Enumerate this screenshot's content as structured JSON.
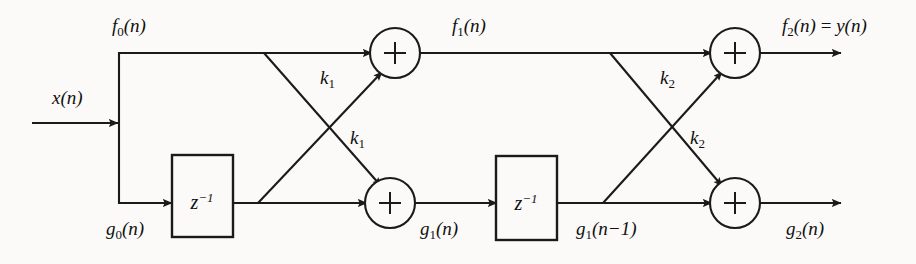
{
  "figure": {
    "kind": "signal-flow-graph",
    "background_color": "#fbfaf8",
    "line_color": "#1a1a1a",
    "width": 916,
    "height": 264
  },
  "signals": {
    "input": {
      "base": "x",
      "sub": "",
      "arg": "(n)"
    },
    "f0": {
      "base": "f",
      "sub": "0",
      "arg": "(n)"
    },
    "g0": {
      "base": "g",
      "sub": "0",
      "arg": "(n)"
    },
    "f1": {
      "base": "f",
      "sub": "1",
      "arg": "(n)"
    },
    "g1": {
      "base": "g",
      "sub": "1",
      "arg": "(n)"
    },
    "g1_delayed": {
      "base": "g",
      "sub": "1",
      "arg": "(n−1)"
    },
    "f2_out": {
      "base": "f",
      "sub": "2",
      "arg": "(n)",
      "equals": " = ",
      "alias_base": "y",
      "alias_arg": "(n)"
    },
    "g2": {
      "base": "g",
      "sub": "2",
      "arg": "(n)"
    }
  },
  "coefficients": [
    {
      "id": "k1-upper",
      "base": "k",
      "sub": "1"
    },
    {
      "id": "k1-lower",
      "base": "k",
      "sub": "1"
    },
    {
      "id": "k2-upper",
      "base": "k",
      "sub": "2"
    },
    {
      "id": "k2-lower",
      "base": "k",
      "sub": "2"
    }
  ],
  "blocks": {
    "delay1": {
      "base": "z",
      "sup": "−1"
    },
    "delay2": {
      "base": "z",
      "sup": "−1"
    }
  },
  "adders": [
    {
      "id": "adder-f1",
      "symbol": "+"
    },
    {
      "id": "adder-g1",
      "symbol": "+"
    },
    {
      "id": "adder-f2",
      "symbol": "+"
    },
    {
      "id": "adder-g2",
      "symbol": "+"
    }
  ]
}
